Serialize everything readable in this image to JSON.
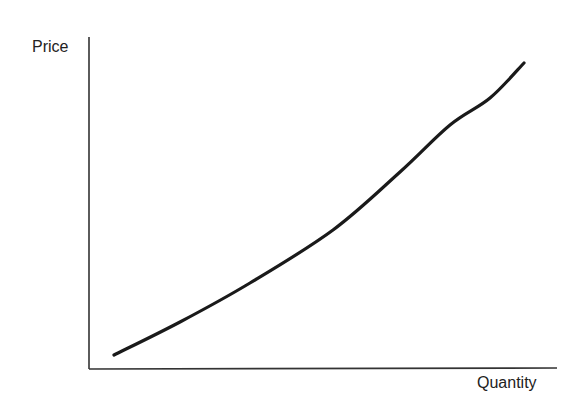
{
  "chart_data": {
    "type": "line",
    "title": "",
    "xlabel": "Quantity",
    "ylabel": "Price",
    "grid": false,
    "legend": null,
    "ticks": {
      "x": [],
      "y": []
    },
    "series": [
      {
        "name": "curve",
        "color": "#1a1a1a",
        "points_px": [
          [
            114,
            355
          ],
          [
            180,
            322
          ],
          [
            250,
            283
          ],
          [
            333,
            230
          ],
          [
            400,
            172
          ],
          [
            450,
            125
          ],
          [
            490,
            98
          ],
          [
            524,
            63
          ]
        ],
        "x_normalized": [
          0.05,
          0.19,
          0.34,
          0.52,
          0.66,
          0.77,
          0.86,
          0.93
        ],
        "y_normalized": [
          0.04,
          0.14,
          0.26,
          0.42,
          0.59,
          0.74,
          0.82,
          0.92
        ]
      }
    ]
  },
  "axes": {
    "y_label": "Price",
    "x_label": "Quantity",
    "color": "#333333"
  }
}
